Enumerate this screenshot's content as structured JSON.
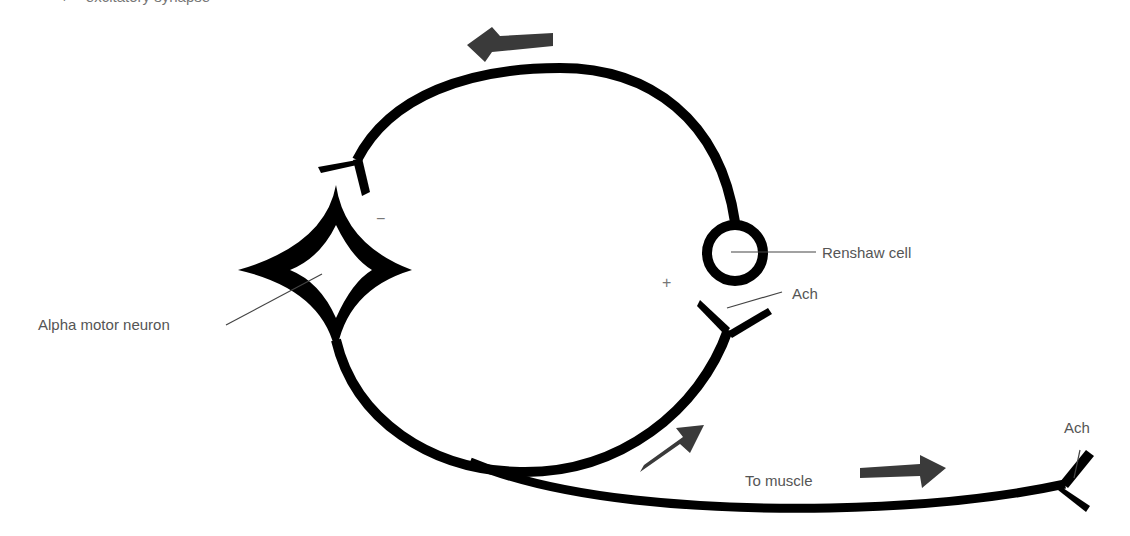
{
  "header": {
    "cutoff_text": "+ = excitatory synapse"
  },
  "labels": {
    "renshaw_cell": "Renshaw cell",
    "ach_renshaw": "Ach",
    "ach_muscle": "Ach",
    "alpha_motor_neuron": "Alpha motor neuron",
    "to_muscle": "To muscle",
    "plus_sign": "+",
    "minus_sign": "−"
  },
  "colors": {
    "line": "#000000",
    "arrow": "#3a3a3a",
    "label_text": "#555555",
    "leader_line": "#444444"
  }
}
